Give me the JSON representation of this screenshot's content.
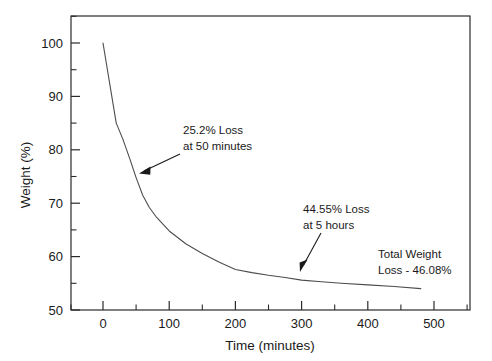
{
  "chart_data": {
    "type": "line",
    "title": "",
    "xlabel": "Time (minutes)",
    "ylabel": "Weight (%)",
    "xlim": [
      -50,
      550
    ],
    "ylim": [
      50,
      105
    ],
    "xticks": [
      0,
      100,
      200,
      300,
      400,
      500
    ],
    "yticks": [
      50,
      60,
      70,
      80,
      90,
      100
    ],
    "xtick_labels": [
      "0",
      "100",
      "200",
      "300",
      "400",
      "500"
    ],
    "ytick_labels": [
      "50",
      "60",
      "70",
      "80",
      "90",
      "100"
    ],
    "x_minor_step": 50,
    "y_minor_step": 5,
    "grid": false,
    "legend": false,
    "series": [
      {
        "name": "Weight loss",
        "color": "#4d4d4d",
        "x": [
          0,
          10,
          20,
          30,
          40,
          50,
          60,
          70,
          80,
          100,
          125,
          150,
          175,
          200,
          225,
          250,
          275,
          300,
          330,
          360,
          400,
          440,
          480
        ],
        "y": [
          100,
          92.5,
          85.0,
          82.0,
          78.5,
          74.8,
          71.5,
          69.2,
          67.5,
          64.8,
          62.4,
          60.6,
          59.0,
          57.6,
          57.0,
          56.5,
          56.1,
          55.6,
          55.3,
          55.0,
          54.7,
          54.4,
          54.0
        ]
      }
    ],
    "annotations": [
      {
        "id": "annot-50min",
        "lines": [
          "25.2% Loss",
          "at 50 minutes"
        ],
        "text_x": 183,
        "text_y": 134,
        "arrow_from_x": 180,
        "arrow_from_y": 154,
        "arrow_to_x": 139,
        "arrow_to_y": 173,
        "point_x": 50,
        "point_y": 74.8
      },
      {
        "id": "annot-5hours",
        "lines": [
          "44.55% Loss",
          "at 5 hours"
        ],
        "text_x": 303,
        "text_y": 213,
        "arrow_from_x": 321,
        "arrow_from_y": 233,
        "arrow_to_x": 300,
        "arrow_to_y": 272,
        "point_x": 300,
        "point_y": 55.45
      },
      {
        "id": "annot-total",
        "lines": [
          "Total Weight",
          "Loss - 46.08%"
        ],
        "text_x": 378,
        "text_y": 258,
        "arrow_from_x": null,
        "arrow_from_y": null,
        "arrow_to_x": null,
        "arrow_to_y": null,
        "point_x": null,
        "point_y": null
      }
    ]
  },
  "axes": {
    "frame_color": "#2b2b2b",
    "line_color": "#4d4d4d",
    "background": "#ffffff"
  }
}
